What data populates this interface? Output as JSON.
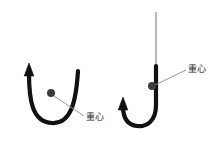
{
  "figure": {
    "type": "physics-diagram",
    "background_color": "#ffffff",
    "stroke_color": "#111111",
    "leader_line_color": "#9a9a9a",
    "thin_rod_color": "#a8a8a8",
    "label_color": "#2b2b2b",
    "panels": [
      {
        "id": "left-panel",
        "name": "u-shaped-rod",
        "shape": "U",
        "arrow_direction": "up",
        "arrow_side": "left",
        "center_of_gravity": {
          "x": 51,
          "y": 93,
          "radius": 4
        },
        "label": {
          "text": "重心",
          "x": 86,
          "y": 117
        },
        "leader_line": {
          "x1": 54,
          "y1": 96,
          "x2": 84,
          "y2": 116
        }
      },
      {
        "id": "right-panel",
        "name": "j-hook-rod-with-stem",
        "shape": "J",
        "arrow_direction": "up",
        "arrow_side": "left",
        "has_thin_stem": true,
        "stem": {
          "x": 156,
          "y_top": 12,
          "y_bottom": 66
        },
        "center_of_gravity": {
          "x": 152,
          "y": 86,
          "radius": 4
        },
        "label": {
          "text": "重心",
          "x": 188,
          "y": 69
        },
        "leader_line": {
          "x1": 156,
          "y1": 84,
          "x2": 186,
          "y2": 70
        }
      }
    ]
  }
}
